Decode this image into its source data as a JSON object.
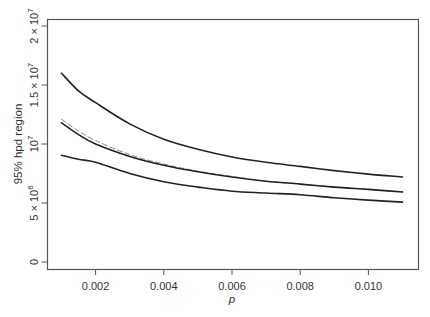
{
  "chart_data": {
    "type": "line",
    "title": "",
    "xlabel": "p",
    "ylabel": "95% hpd region",
    "xlim": [
      0.0007,
      0.0115
    ],
    "ylim": [
      -600000,
      20500000
    ],
    "grid": false,
    "legend": null,
    "x_ticks": [
      0.002,
      0.004,
      0.006,
      0.008,
      0.01
    ],
    "x_tick_labels": [
      "0.002",
      "0.004",
      "0.006",
      "0.008",
      "0.010"
    ],
    "y_ticks": [
      0,
      5000000,
      10000000,
      15000000,
      20000000
    ],
    "y_tick_labels": [
      {
        "base": "0",
        "exp": ""
      },
      {
        "base": "5 × 10",
        "exp": "6"
      },
      {
        "base": "10",
        "exp": "7"
      },
      {
        "base": "1.5 × 10",
        "exp": "7"
      },
      {
        "base": "2 × 10",
        "exp": "7"
      }
    ],
    "x": [
      0.001,
      0.0015,
      0.002,
      0.003,
      0.004,
      0.005,
      0.006,
      0.007,
      0.008,
      0.009,
      0.01,
      0.011
    ],
    "series": [
      {
        "name": "upper bound",
        "style": "solid",
        "color": "#222222",
        "values": [
          16000000,
          14500000,
          13500000,
          11700000,
          10400000,
          9550000,
          8900000,
          8450000,
          8100000,
          7750000,
          7450000,
          7200000
        ]
      },
      {
        "name": "estimate (dashed)",
        "style": "dashed",
        "color": "#888888",
        "values": [
          12100000,
          11100000,
          10300000,
          9100000,
          8300000,
          7700000,
          7250000,
          6850000,
          6600000,
          6350000,
          6150000,
          5950000
        ]
      },
      {
        "name": "estimate (solid)",
        "style": "solid",
        "color": "#222222",
        "values": [
          11800000,
          10800000,
          10000000,
          8950000,
          8200000,
          7650000,
          7200000,
          6850000,
          6600000,
          6350000,
          6150000,
          5930000
        ]
      },
      {
        "name": "lower bound",
        "style": "solid",
        "color": "#222222",
        "values": [
          9050000,
          8700000,
          8450000,
          7500000,
          6800000,
          6350000,
          6000000,
          5850000,
          5700000,
          5450000,
          5250000,
          5080000
        ]
      }
    ]
  }
}
